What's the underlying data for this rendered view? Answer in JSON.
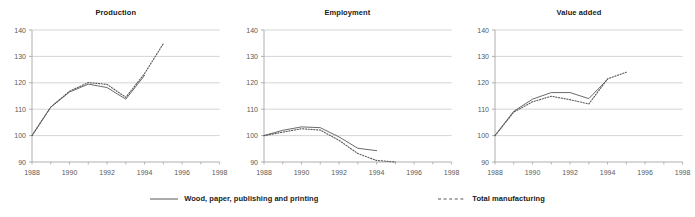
{
  "chart_data": [
    {
      "type": "line",
      "title": "Production",
      "xlabel": "",
      "ylabel": "",
      "xlim": [
        1988,
        1998
      ],
      "ylim": [
        90,
        140
      ],
      "yticks": [
        90,
        100,
        110,
        120,
        130,
        140
      ],
      "xticks": [
        1988,
        1990,
        1992,
        1994,
        1996,
        1998
      ],
      "xminorticks": [
        1988,
        1989,
        1990,
        1991,
        1992,
        1993,
        1994,
        1995,
        1996,
        1997,
        1998
      ],
      "grid": true,
      "legend_position": "bottom",
      "series": [
        {
          "name": "Wood, paper, publishing and printing",
          "style": "solid",
          "x": [
            1988,
            1989,
            1990,
            1991,
            1992,
            1993,
            1994
          ],
          "values": [
            100.0,
            110.8,
            116.5,
            119.5,
            118.2,
            113.8,
            122.8
          ]
        },
        {
          "name": "Total manufacturing",
          "style": "dashed",
          "x": [
            1988,
            1989,
            1990,
            1991,
            1992,
            1993,
            1994,
            1995
          ],
          "values": [
            100.0,
            110.8,
            116.8,
            120.1,
            119.4,
            114.5,
            123.5,
            134.8
          ]
        }
      ]
    },
    {
      "type": "line",
      "title": "Employment",
      "xlabel": "",
      "ylabel": "",
      "xlim": [
        1988,
        1998
      ],
      "ylim": [
        90,
        140
      ],
      "yticks": [
        90,
        100,
        110,
        120,
        130,
        140
      ],
      "xticks": [
        1988,
        1990,
        1992,
        1994,
        1996,
        1998
      ],
      "xminorticks": [
        1988,
        1989,
        1990,
        1991,
        1992,
        1993,
        1994,
        1995,
        1996,
        1997,
        1998
      ],
      "grid": true,
      "legend_position": "bottom",
      "series": [
        {
          "name": "Wood, paper, publishing and printing",
          "style": "solid",
          "x": [
            1988,
            1989,
            1990,
            1991,
            1992,
            1993,
            1994
          ],
          "values": [
            100.0,
            102.0,
            103.3,
            103.0,
            99.5,
            95.2,
            94.3
          ]
        },
        {
          "name": "Total manufacturing",
          "style": "dashed",
          "x": [
            1988,
            1989,
            1990,
            1991,
            1992,
            1993,
            1994,
            1995
          ],
          "values": [
            100.0,
            101.3,
            102.6,
            102.1,
            98.2,
            93.2,
            90.6,
            90.0
          ]
        }
      ]
    },
    {
      "type": "line",
      "title": "Value added",
      "xlabel": "",
      "ylabel": "",
      "xlim": [
        1988,
        1998
      ],
      "ylim": [
        90,
        140
      ],
      "yticks": [
        90,
        100,
        110,
        120,
        130,
        140
      ],
      "xticks": [
        1988,
        1990,
        1992,
        1994,
        1996,
        1998
      ],
      "xminorticks": [
        1988,
        1989,
        1990,
        1991,
        1992,
        1993,
        1994,
        1995,
        1996,
        1997,
        1998
      ],
      "grid": true,
      "legend_position": "bottom",
      "series": [
        {
          "name": "Wood, paper, publishing and printing",
          "style": "solid",
          "x": [
            1988,
            1989,
            1990,
            1991,
            1992,
            1993,
            1994
          ],
          "values": [
            100.0,
            109.2,
            113.8,
            116.3,
            116.3,
            114.0,
            121.3
          ]
        },
        {
          "name": "Total manufacturing",
          "style": "dashed",
          "x": [
            1988,
            1989,
            1990,
            1991,
            1992,
            1993,
            1994,
            1995
          ],
          "values": [
            100.0,
            108.9,
            112.8,
            114.9,
            113.6,
            112.0,
            121.5,
            124.0
          ]
        }
      ]
    }
  ],
  "legend": {
    "entries": [
      {
        "label": "Wood, paper, publishing and printing",
        "style": "solid"
      },
      {
        "label": "Total manufacturing",
        "style": "dashed"
      }
    ]
  },
  "colors": {
    "series_solid": "#595959",
    "series_dashed": "#595959",
    "grid": "#c9c9c9",
    "axis": "#a6a6a6",
    "tick_text": "#5a5a5a",
    "title_text": "#1a1a1a",
    "background": "#ffffff"
  }
}
